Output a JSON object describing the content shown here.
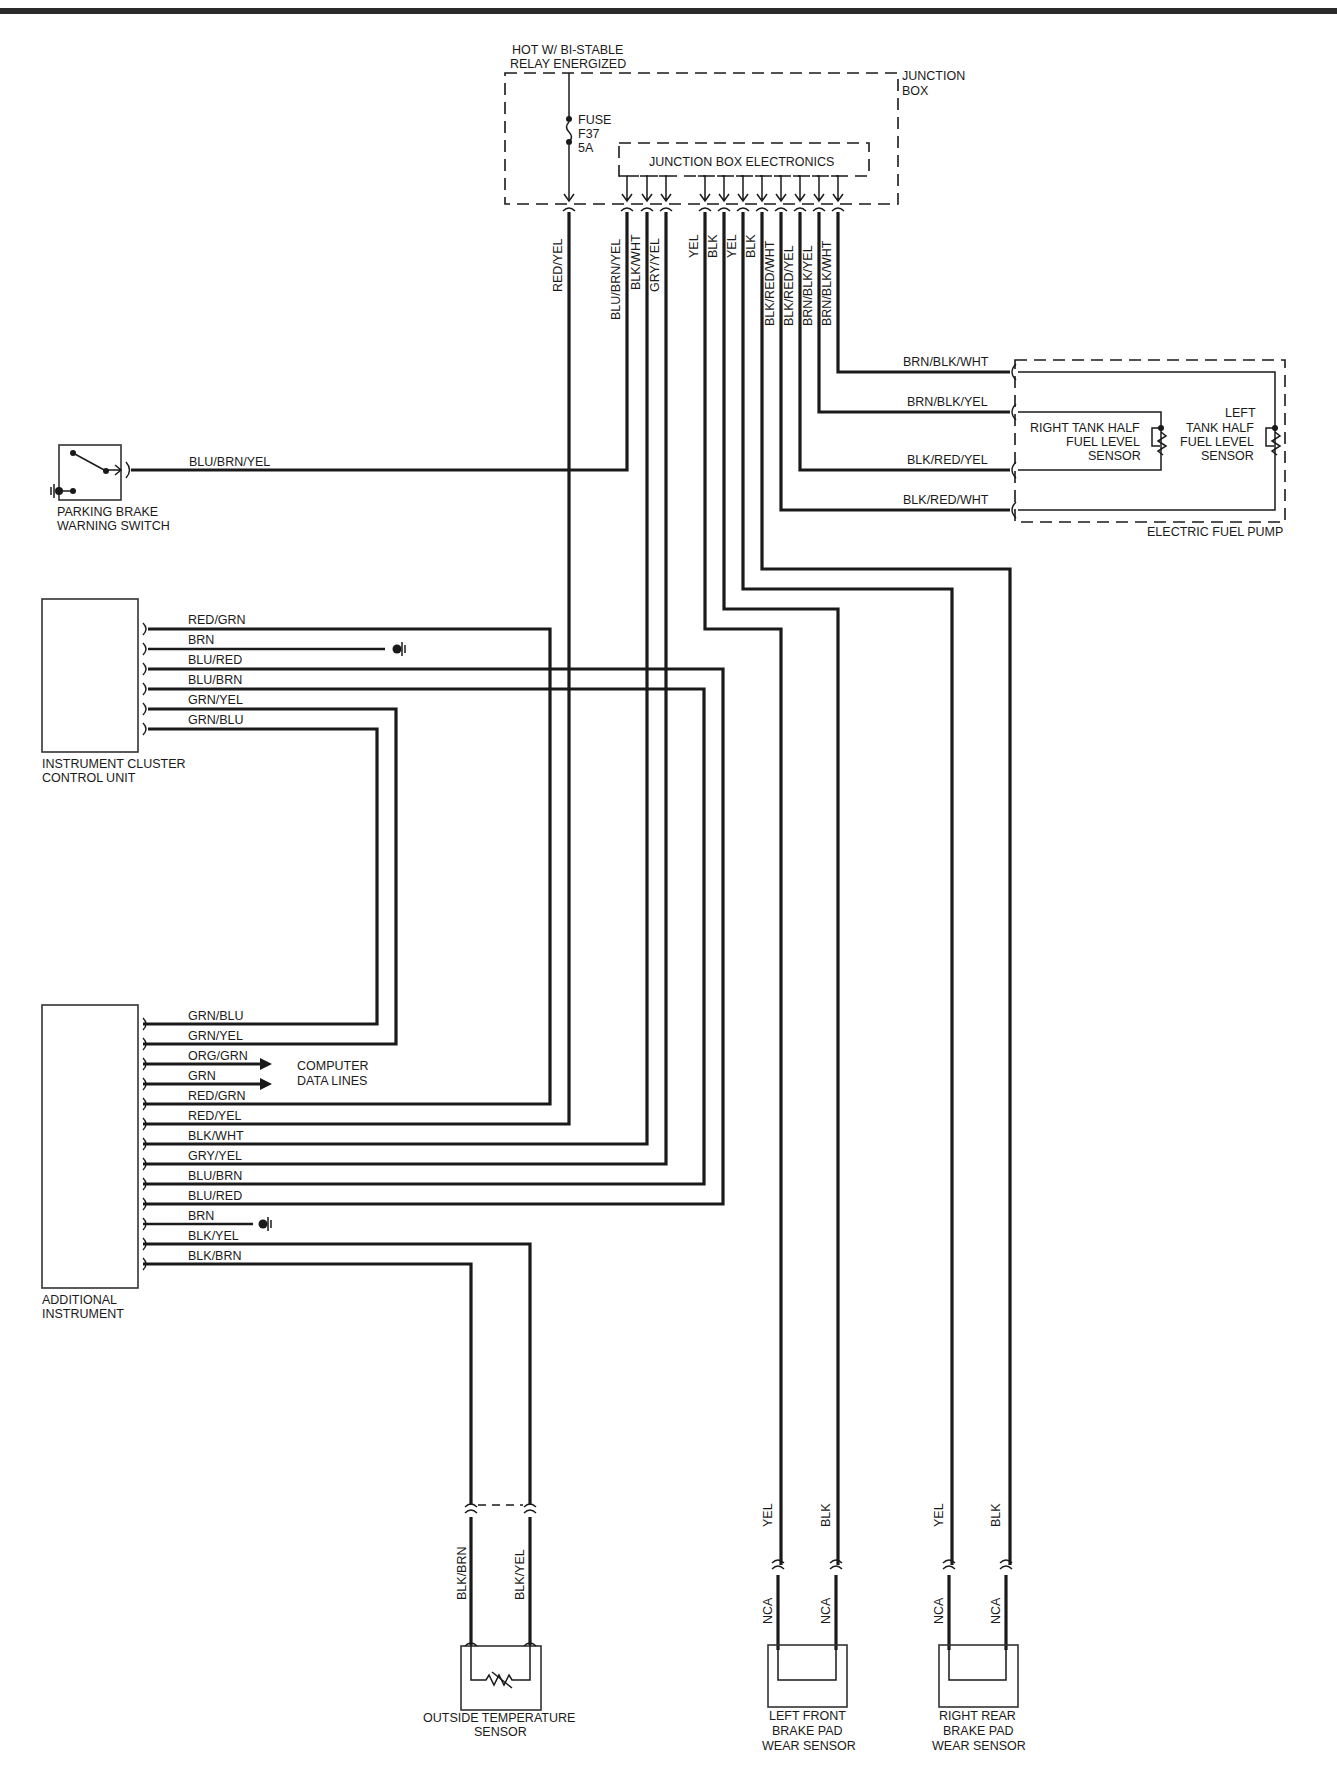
{
  "diagram": {
    "junction_box": {
      "power_label_line1": "HOT W/ BI-STABLE",
      "power_label_line2": "RELAY ENERGIZED",
      "box_label_line1": "JUNCTION",
      "box_label_line2": "BOX",
      "fuse_line1": "FUSE",
      "fuse_line2": "F37",
      "fuse_line3": "5A",
      "electronics_label": "JUNCTION BOX ELECTRONICS",
      "output_wires": [
        "RED/YEL",
        "BLU/BRN/YEL",
        "BLK/WHT",
        "GRY/YEL",
        "YEL",
        "BLK",
        "YEL",
        "BLK",
        "BLK/RED/WHT",
        "BLK/RED/YEL",
        "BRN/BLK/YEL",
        "BRN/BLK/WHT"
      ]
    },
    "fuel_pump": {
      "label": "ELECTRIC FUEL PUMP",
      "wires": [
        "BRN/BLK/WHT",
        "BRN/BLK/YEL",
        "BLK/RED/YEL",
        "BLK/RED/WHT"
      ],
      "right_sensor_line1": "RIGHT TANK HALF",
      "right_sensor_line2": "FUEL LEVEL",
      "right_sensor_line3": "SENSOR",
      "left_sensor_line1": "LEFT",
      "left_sensor_line2": "TANK HALF",
      "left_sensor_line3": "FUEL LEVEL",
      "left_sensor_line4": "SENSOR"
    },
    "parking_brake": {
      "label_line1": "PARKING  BRAKE",
      "label_line2": "WARNING SWITCH",
      "wire": "BLU/BRN/YEL"
    },
    "instrument_cluster": {
      "label_line1": "INSTRUMENT CLUSTER",
      "label_line2": "CONTROL UNIT",
      "wires": [
        "RED/GRN",
        "BRN",
        "BLU/RED",
        "BLU/BRN",
        "GRN/YEL",
        "GRN/BLU"
      ]
    },
    "additional_instrument": {
      "label_line1": "ADDITIONAL",
      "label_line2": "INSTRUMENT",
      "wires": [
        "GRN/BLU",
        "GRN/YEL",
        "ORG/GRN",
        "GRN",
        "RED/GRN",
        "RED/YEL",
        "BLK/WHT",
        "GRY/YEL",
        "BLU/BRN",
        "BLU/RED",
        "BRN",
        "BLK/YEL",
        "BLK/BRN"
      ],
      "data_lines_line1": "COMPUTER",
      "data_lines_line2": "DATA LINES"
    },
    "outside_temp_sensor": {
      "label_line1": "OUTSIDE TEMPERATURE",
      "label_line2": "SENSOR",
      "wires": [
        "BLK/BRN",
        "BLK/YEL"
      ]
    },
    "left_front_brake": {
      "label_line1": "LEFT FRONT",
      "label_line2": "BRAKE PAD",
      "label_line3": "WEAR SENSOR",
      "wires_upper": [
        "YEL",
        "BLK"
      ],
      "wires_lower": [
        "NCA",
        "NCA"
      ]
    },
    "right_rear_brake": {
      "label_line1": "RIGHT REAR",
      "label_line2": "BRAKE PAD",
      "label_line3": "WEAR SENSOR",
      "wires_upper": [
        "YEL",
        "BLK"
      ],
      "wires_lower": [
        "NCA",
        "NCA"
      ]
    }
  }
}
